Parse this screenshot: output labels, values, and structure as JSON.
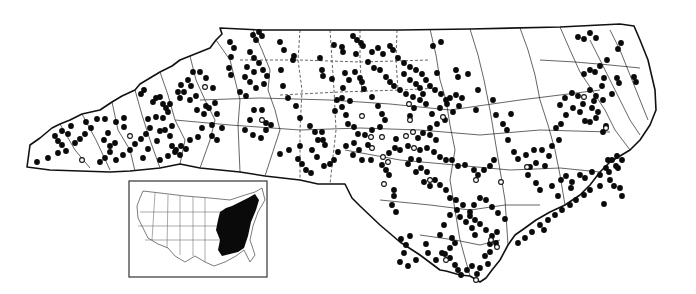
{
  "map": {
    "title": "",
    "region": "North Carolina",
    "legend": {
      "filled_dot": "record (filled circle)",
      "open_dot": "record (open circle)"
    },
    "colors": {
      "ink": "#0a0a0a",
      "background": "#ffffff"
    },
    "inset": {
      "region": "United States",
      "shaded_area": "Eastern United States",
      "box": {
        "x": 129,
        "y": 181,
        "w": 138,
        "h": 96
      }
    },
    "filled_dots": [
      [
        37,
        162
      ],
      [
        48,
        158
      ],
      [
        58,
        153
      ],
      [
        66,
        151
      ],
      [
        62,
        145
      ],
      [
        58,
        141
      ],
      [
        55,
        136
      ],
      [
        62,
        131
      ],
      [
        71,
        126
      ],
      [
        68,
        134
      ],
      [
        75,
        143
      ],
      [
        80,
        139
      ],
      [
        85,
        134
      ],
      [
        91,
        128
      ],
      [
        86,
        122
      ],
      [
        97,
        119
      ],
      [
        105,
        119
      ],
      [
        116,
        122
      ],
      [
        124,
        127
      ],
      [
        124,
        118
      ],
      [
        108,
        133
      ],
      [
        104,
        140
      ],
      [
        110,
        146
      ],
      [
        115,
        143
      ],
      [
        110,
        152
      ],
      [
        105,
        158
      ],
      [
        100,
        162
      ],
      [
        116,
        160
      ],
      [
        123,
        155
      ],
      [
        130,
        150
      ],
      [
        135,
        144
      ],
      [
        141,
        139
      ],
      [
        146,
        134
      ],
      [
        150,
        128
      ],
      [
        148,
        119
      ],
      [
        156,
        117
      ],
      [
        163,
        118
      ],
      [
        165,
        130
      ],
      [
        170,
        136
      ],
      [
        172,
        146
      ],
      [
        176,
        150
      ],
      [
        181,
        146
      ],
      [
        175,
        152
      ],
      [
        168,
        156
      ],
      [
        160,
        160
      ],
      [
        143,
        158
      ],
      [
        148,
        149
      ],
      [
        157,
        141
      ],
      [
        160,
        131
      ],
      [
        168,
        112
      ],
      [
        163,
        104
      ],
      [
        170,
        104
      ],
      [
        180,
        98
      ],
      [
        184,
        92
      ],
      [
        191,
        86
      ],
      [
        196,
        96
      ],
      [
        206,
        106
      ],
      [
        213,
        88
      ],
      [
        206,
        78
      ],
      [
        200,
        72
      ],
      [
        193,
        72
      ],
      [
        188,
        80
      ],
      [
        181,
        85
      ],
      [
        178,
        92
      ],
      [
        190,
        100
      ],
      [
        144,
        90
      ],
      [
        141,
        94
      ],
      [
        156,
        98
      ],
      [
        160,
        97
      ],
      [
        166,
        108
      ],
      [
        172,
        126
      ],
      [
        153,
        102
      ],
      [
        197,
        110
      ],
      [
        204,
        114
      ],
      [
        209,
        108
      ],
      [
        215,
        103
      ],
      [
        217,
        114
      ],
      [
        212,
        125
      ],
      [
        202,
        128
      ],
      [
        198,
        137
      ],
      [
        190,
        140
      ],
      [
        186,
        149
      ],
      [
        180,
        155
      ],
      [
        212,
        136
      ],
      [
        217,
        140
      ],
      [
        222,
        128
      ],
      [
        230,
        42
      ],
      [
        234,
        48
      ],
      [
        231,
        57
      ],
      [
        229,
        68
      ],
      [
        231,
        75
      ],
      [
        253,
        35
      ],
      [
        259,
        32
      ],
      [
        262,
        36
      ],
      [
        256,
        40
      ],
      [
        250,
        52
      ],
      [
        254,
        58
      ],
      [
        259,
        63
      ],
      [
        263,
        70
      ],
      [
        267,
        76
      ],
      [
        264,
        84
      ],
      [
        256,
        88
      ],
      [
        254,
        72
      ],
      [
        247,
        67
      ],
      [
        245,
        77
      ],
      [
        250,
        82
      ],
      [
        240,
        92
      ],
      [
        246,
        96
      ],
      [
        254,
        110
      ],
      [
        262,
        110
      ],
      [
        250,
        120
      ],
      [
        245,
        130
      ],
      [
        253,
        135
      ],
      [
        261,
        138
      ],
      [
        266,
        123
      ],
      [
        271,
        125
      ],
      [
        266,
        130
      ],
      [
        280,
        42
      ],
      [
        284,
        50
      ],
      [
        294,
        56
      ],
      [
        293,
        60
      ],
      [
        281,
        70
      ],
      [
        283,
        86
      ],
      [
        288,
        98
      ],
      [
        296,
        106
      ],
      [
        300,
        118
      ],
      [
        310,
        126
      ],
      [
        315,
        132
      ],
      [
        322,
        132
      ],
      [
        318,
        140
      ],
      [
        325,
        145
      ],
      [
        312,
        150
      ],
      [
        300,
        146
      ],
      [
        289,
        150
      ],
      [
        280,
        154
      ],
      [
        298,
        159
      ],
      [
        302,
        164
      ],
      [
        306,
        170
      ],
      [
        311,
        173
      ],
      [
        317,
        157
      ],
      [
        323,
        140
      ],
      [
        335,
        111
      ],
      [
        342,
        98
      ],
      [
        350,
        101
      ],
      [
        342,
        107
      ],
      [
        346,
        115
      ],
      [
        348,
        124
      ],
      [
        354,
        127
      ],
      [
        358,
        134
      ],
      [
        354,
        143
      ],
      [
        346,
        146
      ],
      [
        338,
        152
      ],
      [
        334,
        160
      ],
      [
        330,
        164
      ],
      [
        324,
        166
      ],
      [
        334,
        45
      ],
      [
        342,
        47
      ],
      [
        353,
        36
      ],
      [
        357,
        40
      ],
      [
        361,
        43
      ],
      [
        363,
        46
      ],
      [
        356,
        54
      ],
      [
        343,
        52
      ],
      [
        320,
        58
      ],
      [
        322,
        70
      ],
      [
        323,
        76
      ],
      [
        332,
        79
      ],
      [
        337,
        100
      ],
      [
        343,
        88
      ],
      [
        349,
        80
      ],
      [
        345,
        73
      ],
      [
        355,
        72
      ],
      [
        360,
        78
      ],
      [
        362,
        82
      ],
      [
        364,
        89
      ],
      [
        372,
        97
      ],
      [
        378,
        106
      ],
      [
        382,
        114
      ],
      [
        385,
        120
      ],
      [
        380,
        127
      ],
      [
        372,
        130
      ],
      [
        365,
        135
      ],
      [
        368,
        145
      ],
      [
        359,
        150
      ],
      [
        353,
        155
      ],
      [
        362,
        160
      ],
      [
        371,
        160
      ],
      [
        382,
        165
      ],
      [
        386,
        170
      ],
      [
        389,
        175
      ],
      [
        394,
        190
      ],
      [
        394,
        196
      ],
      [
        392,
        205
      ],
      [
        396,
        212
      ],
      [
        410,
        236
      ],
      [
        401,
        239
      ],
      [
        406,
        245
      ],
      [
        404,
        253
      ],
      [
        400,
        262
      ],
      [
        408,
        266
      ],
      [
        416,
        260
      ],
      [
        426,
        244
      ],
      [
        428,
        253
      ],
      [
        436,
        260
      ],
      [
        442,
        253
      ],
      [
        452,
        238
      ],
      [
        455,
        243
      ],
      [
        450,
        248
      ],
      [
        445,
        254
      ],
      [
        450,
        258
      ],
      [
        455,
        265
      ],
      [
        458,
        270
      ],
      [
        461,
        275
      ],
      [
        467,
        270
      ],
      [
        472,
        266
      ],
      [
        477,
        274
      ],
      [
        480,
        268
      ],
      [
        485,
        256
      ],
      [
        488,
        264
      ],
      [
        490,
        252
      ],
      [
        490,
        244
      ],
      [
        475,
        235
      ],
      [
        472,
        228
      ],
      [
        466,
        222
      ],
      [
        460,
        217
      ],
      [
        457,
        210
      ],
      [
        450,
        215
      ],
      [
        444,
        225
      ],
      [
        440,
        235
      ],
      [
        470,
        216
      ],
      [
        475,
        220
      ],
      [
        480,
        224
      ],
      [
        486,
        230
      ],
      [
        492,
        236
      ],
      [
        496,
        243
      ],
      [
        497,
        232
      ],
      [
        505,
        219
      ],
      [
        498,
        213
      ],
      [
        492,
        207
      ],
      [
        486,
        200
      ],
      [
        480,
        198
      ],
      [
        474,
        205
      ],
      [
        470,
        212
      ],
      [
        463,
        205
      ],
      [
        456,
        200
      ],
      [
        450,
        198
      ],
      [
        446,
        190
      ],
      [
        440,
        185
      ],
      [
        435,
        180
      ],
      [
        430,
        186
      ],
      [
        424,
        182
      ],
      [
        416,
        172
      ],
      [
        408,
        164
      ],
      [
        411,
        159
      ],
      [
        420,
        150
      ],
      [
        427,
        148
      ],
      [
        434,
        152
      ],
      [
        440,
        157
      ],
      [
        446,
        160
      ],
      [
        452,
        160
      ],
      [
        458,
        166
      ],
      [
        465,
        165
      ],
      [
        474,
        170
      ],
      [
        478,
        175
      ],
      [
        484,
        170
      ],
      [
        490,
        166
      ],
      [
        494,
        160
      ],
      [
        400,
        150
      ],
      [
        408,
        146
      ],
      [
        418,
        138
      ],
      [
        423,
        133
      ],
      [
        430,
        128
      ],
      [
        437,
        124
      ],
      [
        445,
        120
      ],
      [
        453,
        112
      ],
      [
        459,
        106
      ],
      [
        462,
        98
      ],
      [
        456,
        95
      ],
      [
        450,
        98
      ],
      [
        447,
        104
      ],
      [
        440,
        108
      ],
      [
        432,
        114
      ],
      [
        426,
        104
      ],
      [
        420,
        100
      ],
      [
        413,
        97
      ],
      [
        406,
        94
      ],
      [
        400,
        90
      ],
      [
        394,
        86
      ],
      [
        390,
        82
      ],
      [
        386,
        77
      ],
      [
        380,
        70
      ],
      [
        374,
        68
      ],
      [
        368,
        62
      ],
      [
        372,
        52
      ],
      [
        378,
        48
      ],
      [
        383,
        54
      ],
      [
        390,
        46
      ],
      [
        393,
        50
      ],
      [
        398,
        58
      ],
      [
        404,
        63
      ],
      [
        410,
        67
      ],
      [
        416,
        70
      ],
      [
        422,
        74
      ],
      [
        426,
        80
      ],
      [
        430,
        86
      ],
      [
        435,
        90
      ],
      [
        441,
        94
      ],
      [
        446,
        100
      ],
      [
        404,
        74
      ],
      [
        410,
        80
      ],
      [
        416,
        84
      ],
      [
        420,
        88
      ],
      [
        423,
        94
      ],
      [
        414,
        108
      ],
      [
        410,
        116
      ],
      [
        430,
        135
      ],
      [
        436,
        140
      ],
      [
        419,
        160
      ],
      [
        421,
        168
      ],
      [
        427,
        172
      ],
      [
        389,
        153
      ],
      [
        395,
        148
      ],
      [
        396,
        139
      ],
      [
        433,
        46
      ],
      [
        437,
        73
      ],
      [
        441,
        42
      ],
      [
        456,
        70
      ],
      [
        458,
        77
      ],
      [
        468,
        74
      ],
      [
        478,
        90
      ],
      [
        476,
        110
      ],
      [
        493,
        100
      ],
      [
        496,
        115
      ],
      [
        511,
        114
      ],
      [
        503,
        124
      ],
      [
        507,
        130
      ],
      [
        508,
        140
      ],
      [
        514,
        152
      ],
      [
        518,
        159
      ],
      [
        526,
        155
      ],
      [
        534,
        150
      ],
      [
        542,
        150
      ],
      [
        552,
        146
      ],
      [
        559,
        140
      ],
      [
        536,
        163
      ],
      [
        545,
        166
      ],
      [
        549,
        156
      ],
      [
        528,
        175
      ],
      [
        530,
        167
      ],
      [
        536,
        183
      ],
      [
        540,
        190
      ],
      [
        552,
        186
      ],
      [
        561,
        180
      ],
      [
        566,
        176
      ],
      [
        572,
        182
      ],
      [
        580,
        175
      ],
      [
        585,
        178
      ],
      [
        592,
        172
      ],
      [
        600,
        175
      ],
      [
        606,
        168
      ],
      [
        612,
        160
      ],
      [
        617,
        156
      ],
      [
        622,
        160
      ],
      [
        618,
        168
      ],
      [
        609,
        172
      ],
      [
        610,
        180
      ],
      [
        600,
        186
      ],
      [
        590,
        190
      ],
      [
        584,
        195
      ],
      [
        576,
        200
      ],
      [
        570,
        205
      ],
      [
        562,
        210
      ],
      [
        555,
        215
      ],
      [
        548,
        220
      ],
      [
        544,
        230
      ],
      [
        532,
        232
      ],
      [
        525,
        238
      ],
      [
        518,
        243
      ],
      [
        540,
        225
      ],
      [
        571,
        188
      ],
      [
        558,
        196
      ],
      [
        560,
        105
      ],
      [
        565,
        98
      ],
      [
        572,
        93
      ],
      [
        578,
        96
      ],
      [
        583,
        104
      ],
      [
        592,
        108
      ],
      [
        598,
        112
      ],
      [
        606,
        126
      ],
      [
        603,
        132
      ],
      [
        596,
        118
      ],
      [
        590,
        122
      ],
      [
        580,
        112
      ],
      [
        573,
        108
      ],
      [
        566,
        115
      ],
      [
        561,
        124
      ],
      [
        556,
        128
      ],
      [
        578,
        37
      ],
      [
        584,
        39
      ],
      [
        590,
        33
      ],
      [
        596,
        38
      ],
      [
        621,
        43
      ],
      [
        618,
        49
      ],
      [
        607,
        60
      ],
      [
        600,
        66
      ],
      [
        595,
        72
      ],
      [
        590,
        70
      ],
      [
        584,
        74
      ],
      [
        590,
        90
      ],
      [
        596,
        96
      ],
      [
        603,
        100
      ],
      [
        612,
        94
      ],
      [
        619,
        83
      ],
      [
        617,
        78
      ],
      [
        634,
        77
      ],
      [
        636,
        82
      ],
      [
        604,
        78
      ],
      [
        602,
        86
      ],
      [
        594,
        101
      ],
      [
        585,
        121
      ],
      [
        608,
        160
      ],
      [
        616,
        166
      ],
      [
        620,
        188
      ],
      [
        614,
        186
      ],
      [
        622,
        196
      ],
      [
        604,
        204
      ]
    ],
    "open_dots": [
      [
        82,
        160
      ],
      [
        130,
        136
      ],
      [
        205,
        87
      ],
      [
        262,
        120
      ],
      [
        362,
        116
      ],
      [
        371,
        137
      ],
      [
        383,
        157
      ],
      [
        409,
        104
      ],
      [
        413,
        132
      ],
      [
        414,
        148
      ],
      [
        410,
        120
      ],
      [
        406,
        136
      ],
      [
        384,
        184
      ],
      [
        388,
        162
      ],
      [
        430,
        180
      ],
      [
        443,
        117
      ],
      [
        476,
        180
      ],
      [
        501,
        182
      ],
      [
        584,
        97
      ],
      [
        606,
        128
      ],
      [
        476,
        280
      ],
      [
        527,
        167
      ],
      [
        446,
        260
      ],
      [
        497,
        247
      ],
      [
        491,
        240
      ],
      [
        382,
        137
      ],
      [
        372,
        148
      ]
    ]
  }
}
